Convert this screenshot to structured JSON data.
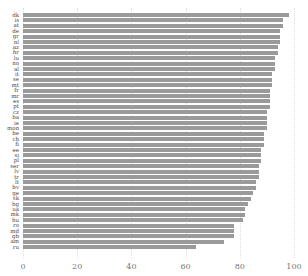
{
  "chart_data": {
    "type": "bar",
    "orientation": "horizontal",
    "title": "",
    "xlabel": "",
    "ylabel": "",
    "xlim": [
      0,
      100
    ],
    "xticks": [
      0,
      20,
      40,
      60,
      80,
      100
    ],
    "grid": true,
    "bar_color": "#9a9a9a",
    "categories": [
      "dk",
      "is",
      "at",
      "de",
      "gr",
      "nl",
      "az",
      "hr",
      "lu",
      "no",
      "al",
      "it",
      "se",
      "mt",
      "fr",
      "mr",
      "es",
      "pt",
      "cz",
      "ba",
      "ie",
      "mon",
      "be",
      "ch",
      "fi",
      "ee",
      "si",
      "pl",
      "ser",
      "lv",
      "tr",
      "lt",
      "bv",
      "ge",
      "sk",
      "bg",
      "ua",
      "mk",
      "hu",
      "ro",
      "md",
      "gb",
      "am",
      "ru"
    ],
    "values": [
      98,
      96,
      96,
      95,
      95,
      95,
      94,
      94,
      93,
      93,
      93,
      92,
      92,
      92,
      91,
      91,
      91,
      91,
      90,
      90,
      90,
      90,
      89,
      89,
      89,
      88,
      88,
      88,
      87,
      87,
      87,
      86,
      86,
      85,
      84,
      83,
      82,
      82,
      81,
      78,
      78,
      78,
      74,
      64
    ]
  }
}
